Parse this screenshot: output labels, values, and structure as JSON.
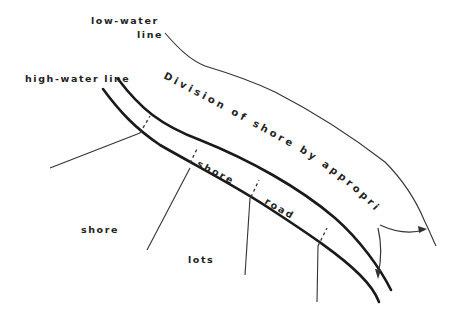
{
  "diagram": {
    "labels": {
      "low_water_line_1": "low-water",
      "low_water_line_2": "line",
      "high_water_line": "high-water line",
      "division_caption": "Division of shore by appropriate rules",
      "shore_region": "shore",
      "lots_region": "lots",
      "road_word_1": "shore",
      "road_word_2": "road"
    },
    "colors": {
      "ink": "#1a1a1a",
      "background": "#ffffff"
    }
  }
}
